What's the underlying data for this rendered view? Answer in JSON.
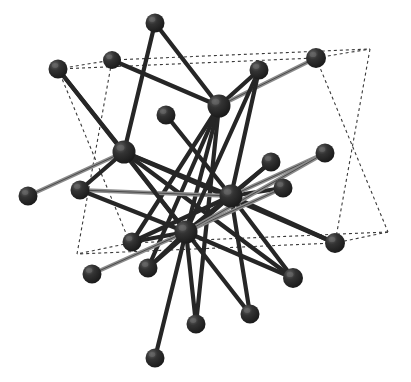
{
  "figure": {
    "name": "crystal-structure-ball-and-stick",
    "caption": "",
    "background_color": "#ffffff",
    "width": 411,
    "height": 382
  },
  "style": {
    "atom_color": "#2b2b2b",
    "atom_shade_color": "#1a1a1a",
    "atom_highlight_color": "#6e6e6e",
    "bond_dark_color": "#262626",
    "bond_grey_color": "#8c8c8c",
    "cell_edge_color": "#3a3a3a",
    "cell_edge_dash": "3 3",
    "cell_edge_width": 1.1,
    "bond_width_dark": 4.2,
    "bond_width_grey": 4.0,
    "atom_radius_hub": 11,
    "atom_radius_outer": 9.5
  },
  "chart_data": {
    "type": "scatter",
    "title": "",
    "xlabel": "",
    "ylabel": "",
    "grid": false,
    "legend": null,
    "xlim": [
      0,
      411
    ],
    "ylim": [
      0,
      382
    ],
    "atoms": [
      {
        "id": "H1",
        "role": "hub",
        "x": 219,
        "y": 106,
        "r": 11.5
      },
      {
        "id": "H2",
        "role": "hub",
        "x": 124,
        "y": 152,
        "r": 11.5
      },
      {
        "id": "H3",
        "role": "hub",
        "x": 231,
        "y": 196,
        "r": 11.5
      },
      {
        "id": "H4",
        "role": "hub",
        "x": 186,
        "y": 232,
        "r": 11.5
      },
      {
        "id": "A1",
        "role": "outer",
        "x": 155,
        "y": 23,
        "r": 9.5
      },
      {
        "id": "A2",
        "role": "outer",
        "x": 112,
        "y": 60,
        "r": 9.0
      },
      {
        "id": "A3",
        "role": "outer",
        "x": 58,
        "y": 69,
        "r": 9.5
      },
      {
        "id": "A4",
        "role": "outer",
        "x": 259,
        "y": 70,
        "r": 9.5
      },
      {
        "id": "A5",
        "role": "outer",
        "x": 316,
        "y": 58,
        "r": 10.0
      },
      {
        "id": "A6",
        "role": "outer",
        "x": 166,
        "y": 115,
        "r": 9.5
      },
      {
        "id": "A7",
        "role": "outer",
        "x": 325,
        "y": 153,
        "r": 9.5
      },
      {
        "id": "A8",
        "role": "outer",
        "x": 271,
        "y": 162,
        "r": 9.5
      },
      {
        "id": "A9",
        "role": "outer",
        "x": 283,
        "y": 188,
        "r": 9.5
      },
      {
        "id": "A10",
        "role": "outer",
        "x": 80,
        "y": 190,
        "r": 9.5
      },
      {
        "id": "A11",
        "role": "outer",
        "x": 28,
        "y": 196,
        "r": 9.5
      },
      {
        "id": "A12",
        "role": "outer",
        "x": 132,
        "y": 242,
        "r": 9.5
      },
      {
        "id": "A13",
        "role": "outer",
        "x": 335,
        "y": 243,
        "r": 10.0
      },
      {
        "id": "A14",
        "role": "outer",
        "x": 92,
        "y": 274,
        "r": 9.5
      },
      {
        "id": "A15",
        "role": "outer",
        "x": 148,
        "y": 268,
        "r": 9.5
      },
      {
        "id": "A16",
        "role": "outer",
        "x": 293,
        "y": 278,
        "r": 10.0
      },
      {
        "id": "A17",
        "role": "outer",
        "x": 250,
        "y": 314,
        "r": 9.5
      },
      {
        "id": "A18",
        "role": "outer",
        "x": 196,
        "y": 324,
        "r": 9.5
      },
      {
        "id": "A19",
        "role": "outer",
        "x": 155,
        "y": 358,
        "r": 9.5
      }
    ],
    "bonds": [
      {
        "from": "H1",
        "to": "A1",
        "shade": "dark"
      },
      {
        "from": "H1",
        "to": "A4",
        "shade": "dark"
      },
      {
        "from": "H1",
        "to": "A5",
        "shade": "grey"
      },
      {
        "from": "H1",
        "to": "A2",
        "shade": "dark"
      },
      {
        "from": "H1",
        "to": "H4",
        "shade": "dark"
      },
      {
        "from": "H1",
        "to": "A12",
        "shade": "dark"
      },
      {
        "from": "H1",
        "to": "A18",
        "shade": "dark"
      },
      {
        "from": "H1",
        "to": "A15",
        "shade": "dark"
      },
      {
        "from": "H2",
        "to": "A1",
        "shade": "dark"
      },
      {
        "from": "H2",
        "to": "A3",
        "shade": "dark"
      },
      {
        "from": "H2",
        "to": "A11",
        "shade": "grey"
      },
      {
        "from": "H2",
        "to": "A10",
        "shade": "dark"
      },
      {
        "from": "H2",
        "to": "H3",
        "shade": "dark"
      },
      {
        "from": "H2",
        "to": "A13",
        "shade": "dark"
      },
      {
        "from": "H2",
        "to": "A17",
        "shade": "dark"
      },
      {
        "from": "H2",
        "to": "A16",
        "shade": "dark"
      },
      {
        "from": "H3",
        "to": "A6",
        "shade": "dark"
      },
      {
        "from": "H3",
        "to": "A8",
        "shade": "dark"
      },
      {
        "from": "H3",
        "to": "A9",
        "shade": "dark"
      },
      {
        "from": "H3",
        "to": "A7",
        "shade": "grey"
      },
      {
        "from": "H3",
        "to": "A4",
        "shade": "dark"
      },
      {
        "from": "H3",
        "to": "A13",
        "shade": "dark"
      },
      {
        "from": "H3",
        "to": "A16",
        "shade": "dark"
      },
      {
        "from": "H3",
        "to": "A17",
        "shade": "dark"
      },
      {
        "from": "H3",
        "to": "A12",
        "shade": "dark"
      },
      {
        "from": "H3",
        "to": "A15",
        "shade": "dark"
      },
      {
        "from": "H3",
        "to": "A10",
        "shade": "grey"
      },
      {
        "from": "H4",
        "to": "A3",
        "shade": "dark"
      },
      {
        "from": "H4",
        "to": "A10",
        "shade": "dark"
      },
      {
        "from": "H4",
        "to": "A12",
        "shade": "dark"
      },
      {
        "from": "H4",
        "to": "A14",
        "shade": "grey"
      },
      {
        "from": "H4",
        "to": "A15",
        "shade": "dark"
      },
      {
        "from": "H4",
        "to": "A18",
        "shade": "dark"
      },
      {
        "from": "H4",
        "to": "A19",
        "shade": "dark"
      },
      {
        "from": "H4",
        "to": "A16",
        "shade": "dark"
      },
      {
        "from": "H4",
        "to": "A8",
        "shade": "dark"
      },
      {
        "from": "H4",
        "to": "A9",
        "shade": "grey"
      },
      {
        "from": "H4",
        "to": "A7",
        "shade": "grey"
      },
      {
        "from": "H4",
        "to": "A4",
        "shade": "dark"
      }
    ],
    "unit_cell": {
      "style": "dashed",
      "vertices": {
        "v0": {
          "x": 58,
          "y": 69
        },
        "v1": {
          "x": 316,
          "y": 58
        },
        "v2": {
          "x": 388,
          "y": 232
        },
        "v3": {
          "x": 130,
          "y": 243
        },
        "v4": {
          "x": 112,
          "y": 60
        },
        "v5": {
          "x": 370,
          "y": 49
        },
        "v6": {
          "x": 335,
          "y": 243
        },
        "v7": {
          "x": 77,
          "y": 254
        }
      },
      "edges": [
        [
          "v0",
          "v1"
        ],
        [
          "v1",
          "v2"
        ],
        [
          "v2",
          "v3"
        ],
        [
          "v3",
          "v0"
        ],
        [
          "v0",
          "v4"
        ],
        [
          "v1",
          "v5"
        ],
        [
          "v2",
          "v6"
        ],
        [
          "v3",
          "v7"
        ],
        [
          "v4",
          "v5"
        ],
        [
          "v5",
          "v6"
        ],
        [
          "v6",
          "v7"
        ],
        [
          "v7",
          "v4"
        ]
      ]
    }
  }
}
